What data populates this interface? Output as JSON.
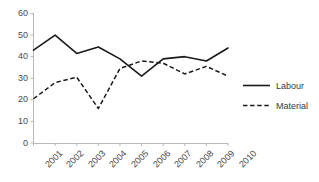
{
  "chart_data": {
    "type": "line",
    "title": "",
    "xlabel": "",
    "ylabel": "",
    "categories": [
      "2001",
      "2002",
      "2003",
      "2004",
      "2005",
      "2006",
      "2007",
      "2008",
      "2009",
      "2010"
    ],
    "series": [
      {
        "name": "Labour",
        "style": "solid",
        "color": "#1a1a1a",
        "values": [
          43,
          50,
          41.5,
          44.5,
          39,
          31,
          39,
          40,
          38,
          44
        ]
      },
      {
        "name": "Material",
        "style": "dashed",
        "color": "#1a1a1a",
        "values": [
          20.5,
          28,
          30.5,
          16,
          34.5,
          38,
          37,
          32,
          35.5,
          31
        ]
      }
    ],
    "ylim": [
      0,
      60
    ],
    "yticks": [
      "0",
      "10",
      "20",
      "30",
      "40",
      "50",
      "60"
    ],
    "grid": false,
    "legend_position": "right"
  },
  "legend": {
    "entries": [
      {
        "label": "Labour",
        "style": "solid"
      },
      {
        "label": "Material",
        "style": "dashed"
      }
    ]
  },
  "axes": {
    "y_axis_name": "value-axis",
    "x_axis_name": "year-axis"
  }
}
